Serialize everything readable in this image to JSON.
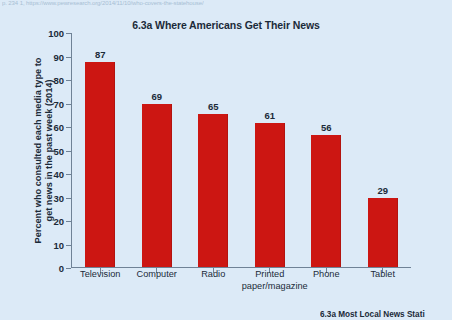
{
  "page": {
    "source_line": "p. 234 1, https://www.pewresearch.org/2014/11/10/who-covers-the-statehouse/",
    "next_figure_caption": "6.3a Most Local News Stati",
    "background_color": "#dceaf7",
    "bar_color": "#cc1612",
    "axis_color": "#6f8296",
    "text_color": "#1b2a39"
  },
  "chart_data": {
    "type": "bar",
    "title": "6.3a Where Americans Get Their News",
    "xlabel": "",
    "ylabel": "Percent who consulted each media type to get news in the past week (2014)",
    "ylabel_line1": "Percent who consulted each media type to",
    "ylabel_line2": "get news in the past week (2014)",
    "categories": [
      "Television",
      "Computer",
      "Radio",
      "Printed paper/magazine",
      "Phone",
      "Tablet"
    ],
    "category_lines": [
      {
        "line1": "Television",
        "line2": ""
      },
      {
        "line1": "Computer",
        "line2": ""
      },
      {
        "line1": "Radio",
        "line2": ""
      },
      {
        "line1": "Printed",
        "line2": "paper/magazine"
      },
      {
        "line1": "Phone",
        "line2": ""
      },
      {
        "line1": "Tablet",
        "line2": ""
      }
    ],
    "values": [
      87,
      69,
      65,
      61,
      56,
      29
    ],
    "value_labels": [
      "87",
      "69",
      "65",
      "61",
      "56",
      "29"
    ],
    "ylim": [
      0,
      100
    ],
    "yticks": [
      100,
      90,
      80,
      70,
      60,
      50,
      40,
      30,
      20,
      10,
      0
    ],
    "ytick_labels": [
      "100",
      "90",
      "80",
      "70",
      "60",
      "50",
      "40",
      "30",
      "20",
      "10",
      "0"
    ],
    "grid": false,
    "legend": null,
    "legend_position": "none"
  }
}
